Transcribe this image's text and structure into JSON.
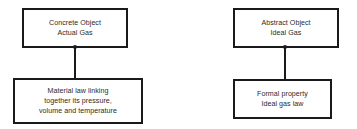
{
  "diagram": {
    "type": "block-diagram",
    "background_color": "#ffffff",
    "border_color": "#1a1a1a",
    "text_color": "#2b2b2b",
    "groups": [
      {
        "name": "concrete-actual-gas",
        "top_node": {
          "lines": [
            "Concrete Object",
            "Actual Gas"
          ]
        },
        "bottom_node": {
          "lines": [
            "Material law linking",
            "together its pressure,",
            "volume and temperature"
          ]
        }
      },
      {
        "name": "abstract-ideal-gas",
        "top_node": {
          "lines": [
            "Abstract Object",
            "Ideal Gas"
          ]
        },
        "bottom_node": {
          "lines": [
            "Formal property",
            "Ideal gas law"
          ]
        }
      }
    ]
  }
}
